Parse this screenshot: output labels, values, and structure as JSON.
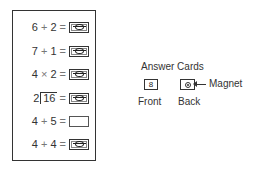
{
  "board": {
    "rows": [
      {
        "left": "6",
        "op": "+",
        "right": "2",
        "equals": "=",
        "answer": "magnet-card"
      },
      {
        "left": "7",
        "op": "+",
        "right": "1",
        "equals": "=",
        "answer": "magnet-card"
      },
      {
        "left": "4",
        "op": "×",
        "right": "2",
        "equals": "=",
        "answer": "magnet-card"
      },
      {
        "divisor": "2",
        "dividend": "16",
        "equals": "=",
        "answer": "magnet-card"
      },
      {
        "left": "4",
        "op": "+",
        "right": "5",
        "equals": "=",
        "answer": "empty"
      },
      {
        "left": "4",
        "op": "+",
        "right": "4",
        "equals": "=",
        "answer": "magnet-card"
      }
    ]
  },
  "legend": {
    "title": "Answer Cards",
    "front_value": "8",
    "front_label": "Front",
    "back_label": "Back",
    "magnet_label": "Magnet"
  }
}
